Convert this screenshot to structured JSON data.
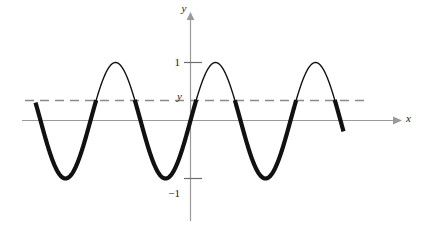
{
  "figure": {
    "background_color": "#ffffff",
    "axis_color": "#9a9a9a",
    "curve_color": "#111111",
    "dashed_color": "#8a8a8a",
    "x_axis_label": "x",
    "y_axis_label": "y",
    "level_label": "y",
    "tick_labels": {
      "top": "1",
      "bottom": "−1"
    }
  },
  "chart_data": {
    "type": "line",
    "title": "",
    "xlabel": "x",
    "ylabel": "y",
    "grid": false,
    "legend": null,
    "ylim": [
      -1.45,
      1.45
    ],
    "xlim": [
      -1.55,
      2.05
    ],
    "yticks": [
      1,
      -1
    ],
    "ytick_labels": [
      "1",
      "−1"
    ],
    "xticks": [],
    "annotations": [
      {
        "text": "y",
        "x": -0.12,
        "y": 0.345,
        "note": "level label at dashed horizontal line"
      },
      {
        "text": "y",
        "x": 0.0,
        "y": 1.48,
        "note": "y-axis name at top of vertical axis"
      },
      {
        "text": "x",
        "x": 2.1,
        "y": 0.03,
        "note": "x-axis name at right of horizontal axis"
      }
    ],
    "reference_lines": [
      {
        "orientation": "horizontal",
        "value": 0.345,
        "style": "dashed",
        "label": "y"
      },
      {
        "orientation": "horizontal",
        "value": 0,
        "style": "solid",
        "label": "x-axis"
      },
      {
        "orientation": "vertical",
        "value": 0,
        "style": "solid",
        "label": "y-axis"
      }
    ],
    "series": [
      {
        "name": "y = sin(x) segments above level y",
        "style": "thin",
        "linewidth": 1.3,
        "values_note": "portions of the sine wave where sin >= 0.345"
      },
      {
        "name": "y = sin(x) segments below level y",
        "style": "thick",
        "linewidth": 4,
        "values_note": "portions of the sine wave where sin < 0.345"
      }
    ],
    "function": "y = sin(2*pi*x)",
    "amplitude": 1,
    "period": 1,
    "x_start": -1.55,
    "x_end": 1.53,
    "peaks_x": [
      -1.27,
      -0.27,
      0.73,
      1.73
    ],
    "peaks_y": [
      1,
      1,
      1,
      1
    ],
    "troughs_x": [
      -1.77,
      -0.77,
      0.23,
      1.23
    ],
    "troughs_y": [
      -1,
      -1,
      -1,
      -1
    ],
    "threshold_level": 0.345
  }
}
